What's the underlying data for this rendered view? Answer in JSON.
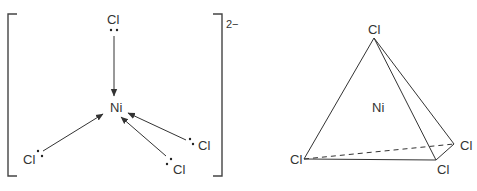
{
  "lewis_structure": {
    "center_atom": "Ni",
    "ligands": [
      {
        "id": "top",
        "label": "Cl"
      },
      {
        "id": "lower-left",
        "label": "Cl"
      },
      {
        "id": "lower-right",
        "label": "Cl"
      },
      {
        "id": "bottom",
        "label": "Cl"
      }
    ],
    "charge": "2−",
    "bond_type": "coordinate (dative) arrows pointing to Ni",
    "lone_pair_dots": "••"
  },
  "tetrahedron": {
    "center_atom": "Ni",
    "vertices": [
      {
        "id": "apex",
        "label": "Cl"
      },
      {
        "id": "left",
        "label": "Cl"
      },
      {
        "id": "front-right",
        "label": "Cl"
      },
      {
        "id": "back-right",
        "label": "Cl"
      }
    ],
    "hidden_edge": "dashed line from left Cl to back-right Cl"
  }
}
